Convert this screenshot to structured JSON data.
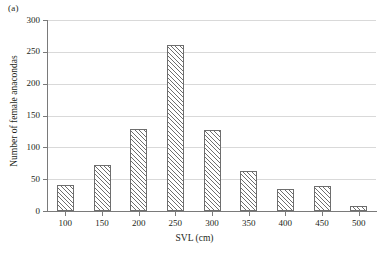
{
  "figure": {
    "panel_label": "(a)"
  },
  "chart_data": {
    "type": "bar",
    "title": "",
    "xlabel": "SVL (cm)",
    "ylabel": "Number of female anacondas",
    "categories": [
      "100",
      "150",
      "200",
      "250",
      "300",
      "350",
      "400",
      "450",
      "500"
    ],
    "values": [
      41,
      73,
      129,
      260,
      127,
      63,
      35,
      40,
      8
    ],
    "xlim": [
      75,
      525
    ],
    "ylim": [
      0,
      300
    ],
    "ytick_labels": [
      "0",
      "50",
      "100",
      "150",
      "200",
      "250",
      "300"
    ],
    "ytick_values": [
      0,
      50,
      100,
      150,
      200,
      250,
      300
    ],
    "xtick_labels": [
      "100",
      "150",
      "200",
      "250",
      "300",
      "350",
      "400",
      "450",
      "500"
    ],
    "xtick_values": [
      100,
      150,
      200,
      250,
      300,
      350,
      400,
      450,
      500
    ],
    "grid": "horizontal",
    "legend": "none",
    "bar_style": "diagonal-hatch",
    "colors": {
      "bar_outline": "#6e6e6e",
      "bar_fill": "#ffffff",
      "hatch": "#6e6e6e",
      "gridline": "#d9d9d9",
      "axis": "#7a7a7a",
      "text": "#231f20"
    }
  }
}
